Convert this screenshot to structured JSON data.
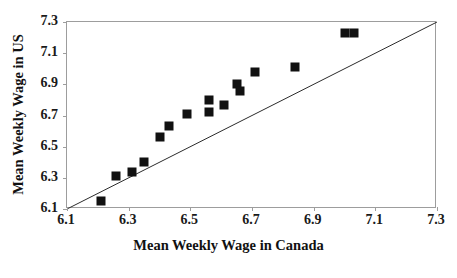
{
  "chart_data": {
    "type": "scatter",
    "title": "",
    "xlabel": "Mean Weekly Wage in Canada",
    "ylabel": "Mean Weekly Wage in US",
    "xlim": [
      6.1,
      7.3
    ],
    "ylim": [
      6.1,
      7.3
    ],
    "grid": false,
    "legend": null,
    "xticks": [
      "6.1",
      "6.3",
      "6.5",
      "6.7",
      "6.9",
      "7.1",
      "7.3"
    ],
    "yticks": [
      "6.1",
      "6.3",
      "6.5",
      "6.7",
      "6.9",
      "7.1",
      "7.3"
    ],
    "xtick_values": [
      6.1,
      6.3,
      6.5,
      6.7,
      6.9,
      7.1,
      7.3
    ],
    "ytick_values": [
      6.1,
      6.3,
      6.5,
      6.7,
      6.9,
      7.1,
      7.3
    ],
    "marker": "filled-square",
    "marker_color": "#111111",
    "series": [
      {
        "name": "observations",
        "x": [
          6.21,
          6.26,
          6.31,
          6.35,
          6.4,
          6.43,
          6.49,
          6.56,
          6.56,
          6.61,
          6.65,
          6.66,
          6.71,
          6.84,
          7.0,
          7.03
        ],
        "y": [
          6.15,
          6.31,
          6.34,
          6.4,
          6.56,
          6.63,
          6.71,
          6.8,
          6.72,
          6.77,
          6.9,
          6.86,
          6.98,
          7.01,
          7.23,
          7.23
        ]
      }
    ],
    "reference_line": {
      "name": "45-degree-line",
      "x": [
        6.1,
        7.3
      ],
      "y": [
        6.1,
        7.3
      ],
      "color": "#2b2b2b"
    }
  },
  "axis_frame_color": "#9d9d9d",
  "background_color": "#ffffff"
}
